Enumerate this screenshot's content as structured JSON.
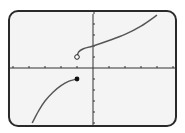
{
  "chart_data": {
    "type": "line",
    "title": "",
    "xlabel": "",
    "ylabel": "",
    "xlim": [
      -5,
      5
    ],
    "ylim": [
      -5,
      5
    ],
    "x_ticks": [
      -5,
      -4,
      -3,
      -2,
      -1,
      1,
      2,
      3,
      4,
      5
    ],
    "y_ticks": [
      -5,
      -4,
      -3,
      -2,
      -1,
      1,
      2,
      3,
      4,
      5
    ],
    "grid": false,
    "legend": null,
    "series": [
      {
        "name": "left-branch",
        "domain": "x <= -1",
        "points": [
          [
            -3.8,
            -5
          ],
          [
            -3.4,
            -3.9
          ],
          [
            -3.0,
            -3.0
          ],
          [
            -2.5,
            -2.2
          ],
          [
            -2.0,
            -1.6
          ],
          [
            -1.5,
            -1.2
          ],
          [
            -1,
            -1
          ]
        ],
        "endpoint": {
          "x": -1,
          "y": -1,
          "style": "closed"
        }
      },
      {
        "name": "right-branch",
        "domain": "x > -1",
        "points": [
          [
            -1,
            1
          ],
          [
            -0.9,
            1.45
          ],
          [
            -0.6,
            1.75
          ],
          [
            0,
            2
          ],
          [
            1,
            2.5
          ],
          [
            2,
            3.05
          ],
          [
            3,
            3.8
          ],
          [
            4,
            4.8
          ]
        ],
        "endpoint": {
          "x": -1,
          "y": 1,
          "style": "open"
        }
      }
    ],
    "annotations": [
      {
        "type": "open-circle",
        "x": -1,
        "y": 1
      },
      {
        "type": "closed-dot",
        "x": -1,
        "y": -1
      }
    ]
  },
  "style": {
    "frame_color": "#2a2a2a",
    "background": "#f4f4f4",
    "curve_color": "#555555",
    "axis_color": "#333333"
  }
}
